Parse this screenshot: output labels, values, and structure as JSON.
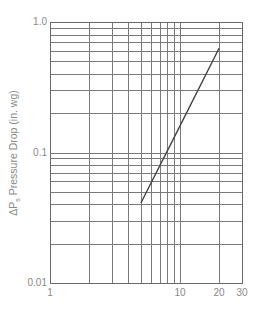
{
  "chart_data": {
    "type": "line",
    "title": "",
    "xlabel": "",
    "ylabel": "ΔPs Pressure Drop (in. wg)",
    "ylabel_parts": {
      "delta": "Δ",
      "symbol": "P",
      "subscript": "s",
      "text": " Pressure Drop (in. wg)"
    },
    "xscale": "log",
    "yscale": "log",
    "xlim": [
      1,
      30
    ],
    "ylim": [
      0.01,
      1.0
    ],
    "grid": true,
    "legend": null,
    "x_ticks": [
      {
        "value": 1,
        "label": "1"
      },
      {
        "value": 10,
        "label": "10"
      },
      {
        "value": 20,
        "label": "20"
      },
      {
        "value": 30,
        "label": "30"
      }
    ],
    "y_ticks": [
      {
        "value": 1.0,
        "label": "1.0"
      },
      {
        "value": 0.1,
        "label": "0.1"
      },
      {
        "value": 0.01,
        "label": "0.01"
      }
    ],
    "x_gridlines": [
      2,
      3,
      4,
      5,
      6,
      7,
      8,
      9,
      10,
      20
    ],
    "y_gridlines": [
      0.02,
      0.03,
      0.04,
      0.05,
      0.06,
      0.07,
      0.08,
      0.09,
      0.1,
      0.2,
      0.3,
      0.4,
      0.5,
      0.6,
      0.7,
      0.8,
      0.9
    ],
    "series": [
      {
        "name": "Pressure drop",
        "x": [
          5,
          10,
          20
        ],
        "y": [
          0.041,
          0.16,
          0.63
        ],
        "color": "#444444"
      }
    ]
  },
  "style": {
    "grid_color": "#7a7a7a",
    "frame_color": "#6a6a6a",
    "line_color": "#444444",
    "label_color": "#8a8a8a"
  }
}
